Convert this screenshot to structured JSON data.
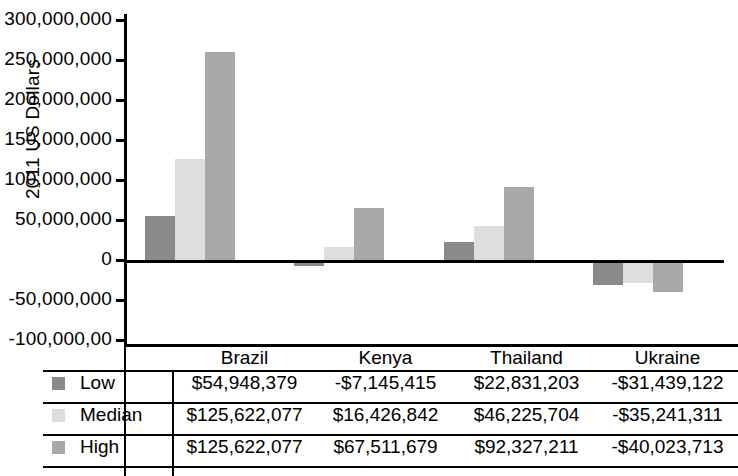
{
  "chart_data": {
    "type": "bar",
    "title": "",
    "xlabel": "",
    "ylabel": "2011 US Dollars",
    "categories": [
      "Brazil",
      "Kenya",
      "Thailand",
      "Ukraine"
    ],
    "ylim": [
      -100000000,
      300000000
    ],
    "ytick_labels": [
      "300,000,000",
      "250,000,000",
      "200,000,000",
      "150,000,000",
      "100,000,000",
      "50,000,000",
      "0",
      "-50,000,000",
      "-100,000,00"
    ],
    "ytick_values": [
      300000000,
      250000000,
      200000000,
      150000000,
      100000000,
      50000000,
      0,
      -50000000,
      -100000000
    ],
    "grid": false,
    "legend_position": "table-left",
    "series": [
      {
        "name": "Low",
        "color": "#8a8a8a",
        "values": [
          54948379,
          -7145415,
          22831203,
          -31439122
        ],
        "plotted": [
          55000000,
          -7000000,
          22000000,
          -31000000
        ],
        "labels": [
          "$54,948,379",
          "-$7,145,415",
          "$22,831,203",
          "-$31,439,122"
        ]
      },
      {
        "name": "Median",
        "color": "#dedede",
        "values": [
          125622077,
          16426842,
          46225704,
          -35241311
        ],
        "plotted": [
          126000000,
          16000000,
          43000000,
          -29000000
        ],
        "labels": [
          "$125,622,077",
          "$16,426,842",
          "$46,225,704",
          "-$35,241,311"
        ]
      },
      {
        "name": "High",
        "color": "#a8a8a8",
        "values": [
          125622077,
          67511679,
          92327211,
          -40023713
        ],
        "plotted": [
          260000000,
          65000000,
          91000000,
          -40000000
        ],
        "labels": [
          "$125,622,077",
          "$67,511,679",
          "$92,327,211",
          "-$40,023,713"
        ]
      }
    ]
  },
  "axis": {
    "ylabel": "2011 US Dollars"
  },
  "table": {
    "column_headers": [
      "Brazil",
      "Kenya",
      "Thailand",
      "Ukraine"
    ],
    "rows": [
      {
        "label": "Low",
        "swatch_color": "#8a8a8a",
        "cells": [
          "$54,948,379",
          "-$7,145,415",
          "$22,831,203",
          "-$31,439,122"
        ]
      },
      {
        "label": "Median",
        "swatch_color": "#dedede",
        "cells": [
          "$125,622,077",
          "$16,426,842",
          "$46,225,704",
          "-$35,241,311"
        ]
      },
      {
        "label": "High",
        "swatch_color": "#a8a8a8",
        "cells": [
          "$125,622,077",
          "$67,511,679",
          "$92,327,211",
          "-$40,023,713"
        ]
      }
    ]
  }
}
